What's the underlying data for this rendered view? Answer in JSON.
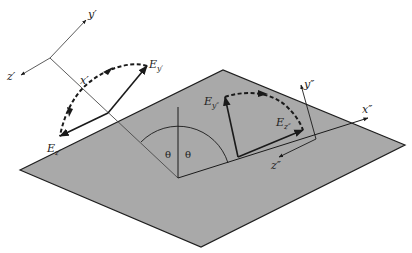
{
  "diagram": {
    "colors": {
      "plane_fill": "#a9a9a9",
      "plane_edge": "#1e1e1e",
      "line": "#1a1a1a",
      "axis": "#4a4a4a",
      "background": "#ffffff"
    },
    "incident_frame": {
      "axis_y": "y′",
      "axis_z": "z′",
      "axis_x": "x′",
      "field_y": {
        "base": "E",
        "sub": "y′"
      },
      "field_z": {
        "base": "E",
        "sub": "z′"
      }
    },
    "reflected_frame": {
      "axis_y": "y″",
      "axis_z": "z″",
      "axis_x": "x″",
      "field_y": {
        "base": "E",
        "sub": "y″"
      },
      "field_z": {
        "base": "E",
        "sub": "z″"
      }
    },
    "angles": {
      "incidence": "θ",
      "reflection": "θ"
    }
  }
}
